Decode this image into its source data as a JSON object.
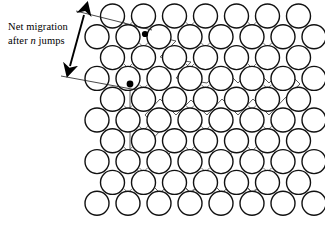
{
  "figure": {
    "name": "interstitial-diffusion-random-walk",
    "background_color": "#ffffff",
    "width": 325,
    "height": 232
  },
  "annotation": {
    "line1_prefix": "Net migration",
    "line2_prefix": "after ",
    "line2_italic": "n",
    "line2_suffix": " jumps",
    "full_text": "Net migration after n jumps"
  },
  "dimension": {
    "name": "net-migration-dimension-arrow",
    "upper_extension": {
      "x1": 76,
      "y1": 11,
      "x2": 152,
      "y2": 30
    },
    "lower_extension": {
      "x1": 61,
      "y1": 76,
      "x2": 137,
      "y2": 90
    },
    "arrow": {
      "x1": 84,
      "y1": 15,
      "x2": 70,
      "y2": 66
    },
    "arrow_color": "#000000",
    "extension_color": "#1a1a1a"
  },
  "lattice": {
    "name": "close-packed-atom-lattice",
    "circle_diameter": 24,
    "circle_radius": 12,
    "h_pitch": 31,
    "v_pitch": 20.8,
    "origin_x": 97,
    "origin_y": 16,
    "row_offset": 15.5,
    "rows": 10,
    "cols_even": 7,
    "cols_odd": 8,
    "stroke_color": "#111111",
    "fill_color": "#ffffff",
    "stroke_width": 1.4
  },
  "markers": [
    {
      "name": "start-interstitial-site",
      "x": 145,
      "y": 34,
      "r": 3.1,
      "color": "#000000"
    },
    {
      "name": "end-interstitial-site",
      "x": 130,
      "y": 84,
      "r": 3.4,
      "color": "#000000"
    }
  ],
  "jump_path": {
    "name": "random-walk-jump-path",
    "color": "#5d5d5d",
    "stroke_width": 1.0,
    "description": "Zig-zag sequence of atomic jumps between interstitial voids",
    "points": [
      [
        145,
        34
      ],
      [
        176,
        41
      ],
      [
        160,
        57
      ],
      [
        191,
        62
      ],
      [
        176,
        78
      ],
      [
        207,
        83
      ],
      [
        222,
        67
      ],
      [
        238,
        83
      ],
      [
        253,
        67
      ],
      [
        269,
        83
      ],
      [
        284,
        68
      ],
      [
        300,
        84
      ],
      [
        284,
        99
      ],
      [
        269,
        115
      ],
      [
        253,
        99
      ],
      [
        238,
        115
      ],
      [
        222,
        99
      ],
      [
        207,
        115
      ],
      [
        191,
        100
      ],
      [
        176,
        115
      ],
      [
        160,
        99
      ],
      [
        145,
        115
      ],
      [
        160,
        131
      ],
      [
        145,
        147
      ],
      [
        161,
        162
      ],
      [
        176,
        147
      ],
      [
        191,
        162
      ],
      [
        207,
        147
      ],
      [
        222,
        162
      ],
      [
        238,
        147
      ],
      [
        253,
        162
      ],
      [
        269,
        147
      ],
      [
        284,
        162
      ],
      [
        269,
        178
      ],
      [
        253,
        193
      ],
      [
        238,
        178
      ],
      [
        222,
        193
      ],
      [
        207,
        178
      ],
      [
        191,
        193
      ],
      [
        176,
        178
      ],
      [
        160,
        193
      ],
      [
        145,
        178
      ],
      [
        130,
        162
      ],
      [
        130,
        131
      ],
      [
        130,
        100
      ],
      [
        130,
        84
      ]
    ]
  },
  "interstitial_crosses": {
    "name": "interstitial-void-crosses",
    "color": "#6a6a6a",
    "stroke_width": 0.9
  }
}
